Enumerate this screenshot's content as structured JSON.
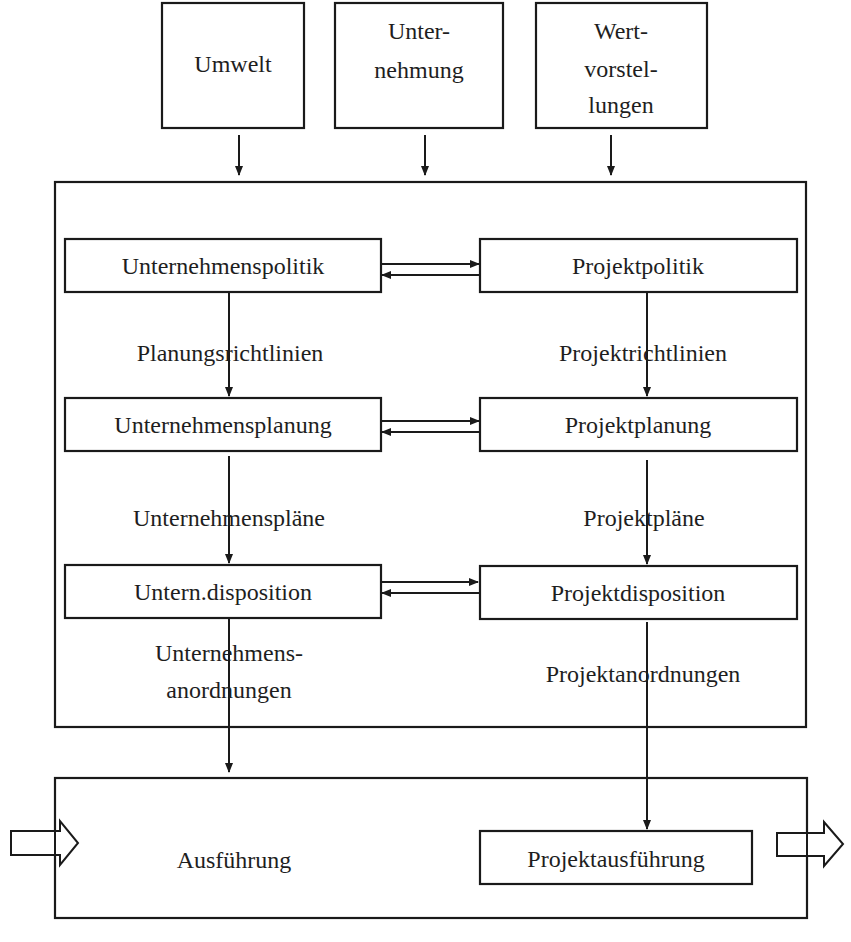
{
  "colors": {
    "stroke": "#1a1a1a",
    "text": "#1e1e1e",
    "background": "#ffffff"
  },
  "inputs": {
    "umwelt": {
      "label": "Umwelt",
      "lines": [
        "Umwelt"
      ],
      "box": [
        162,
        3,
        142,
        125
      ],
      "arrow_x": 239
    },
    "unternehmung": {
      "label": "Unternehmung",
      "lines": [
        "Unter-",
        "nehmung"
      ],
      "box": [
        335,
        3,
        168,
        125
      ],
      "arrow_x": 425
    },
    "wertvorstellungen": {
      "label": "Wertvorstellungen",
      "lines": [
        "Wert-",
        "vorstel-",
        "lungen"
      ],
      "box": [
        536,
        3,
        171,
        125
      ],
      "arrow_x": 611
    }
  },
  "management_frame": {
    "box": [
      55,
      182,
      751,
      545
    ]
  },
  "execution_frame": {
    "box": [
      55,
      778,
      752,
      140
    ],
    "label": "Ausführung"
  },
  "left_column": {
    "boxes": [
      {
        "id": "unternehmenspolitik",
        "label": "Unternehmenspolitik",
        "box": [
          65,
          239,
          316,
          53
        ]
      },
      {
        "id": "unternehmensplanung",
        "label": "Unternehmensplanung",
        "box": [
          65,
          398,
          316,
          53
        ]
      },
      {
        "id": "untern-disposition",
        "label": "Untern.disposition",
        "box": [
          65,
          565,
          316,
          53
        ]
      }
    ],
    "connector_x": 229,
    "flow_labels": {
      "planungsrichtlinien": "Planungsrichtlinien",
      "unternehmensplaene": "Unternehmenspläne",
      "anordnungen_line1": "Unternehmens-",
      "anordnungen_line2": "anordnungen"
    }
  },
  "right_column": {
    "boxes": [
      {
        "id": "projektpolitik",
        "label": "Projektpolitik",
        "box": [
          480,
          239,
          317,
          53
        ]
      },
      {
        "id": "projektplanung",
        "label": "Projektplanung",
        "box": [
          480,
          398,
          317,
          53
        ]
      },
      {
        "id": "projektdisposition",
        "label": "Projektdisposition",
        "box": [
          480,
          566,
          317,
          53
        ]
      }
    ],
    "connector_x": 647,
    "flow_labels": {
      "projektrichtlinien": "Projektrichtlinien",
      "projektplaene": "Projektpläne",
      "projektanordnungen": "Projektanordnungen"
    }
  },
  "projektausfuehrung": {
    "label": "Projektausführung",
    "box": [
      480,
      831,
      272,
      53
    ]
  },
  "bidirectional_links": [
    {
      "between": [
        "Unternehmenspolitik",
        "Projektpolitik"
      ],
      "y_right": 264,
      "y_left": 275
    },
    {
      "between": [
        "Unternehmensplanung",
        "Projektplanung"
      ],
      "y_right": 421,
      "y_left": 432
    },
    {
      "between": [
        "Untern.disposition",
        "Projektdisposition"
      ],
      "y_right": 582,
      "y_left": 593
    }
  ],
  "io_arrows": {
    "input": {
      "icon": "hollow-arrow-right",
      "x_start": 11,
      "x_tip": 78
    },
    "output": {
      "icon": "hollow-arrow-right",
      "x_start": 777,
      "x_tip": 843
    }
  }
}
